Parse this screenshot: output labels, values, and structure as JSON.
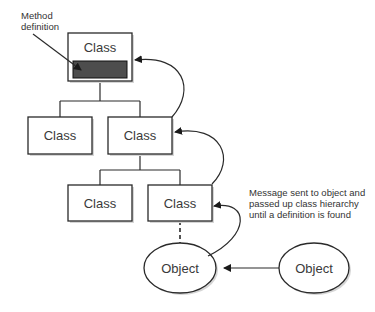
{
  "diagram": {
    "method_label_line1": "Method",
    "method_label_line2": "definition",
    "class_label": "Class",
    "object_label": "Object",
    "note_lines": [
      "Message sent to object and",
      "passed up class hierarchy",
      "until a definition is found"
    ],
    "method_fill_color": "#4d4d4d"
  }
}
